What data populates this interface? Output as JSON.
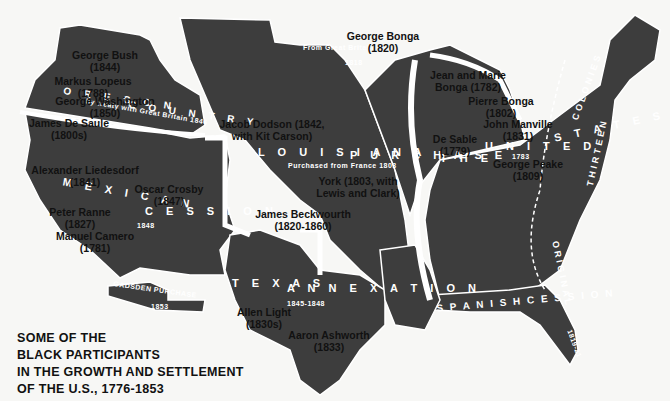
{
  "map": {
    "title_lines": [
      "SOME OF THE",
      "BLACK PARTICIPANTS",
      "IN THE GROWTH AND SETTLEMENT",
      "OF THE U.S., 1776-1853"
    ],
    "colors": {
      "land": "#3d3d3d",
      "border": "#ffffff",
      "background": "#f7f7f5",
      "label": "#111111"
    },
    "regions": {
      "oregon": {
        "name": "OREGON COUNTRY",
        "name_left": "O R E G O N",
        "name_right": "C O U N T R Y",
        "sub": "by treaty with Great Britain 1846"
      },
      "louisiana": {
        "name": "LOUISIANA PURCHASE",
        "name_left": "L O U I S I A N A",
        "name_right": "P U R C H A S E",
        "sub": "Purchased from France 1803"
      },
      "mexican": {
        "name_left": "M E X I C A N",
        "name_right": "C E S S I O N",
        "sub": "1848"
      },
      "texas": {
        "name_left": "T E X A S",
        "name_right": "A N N E X A T I O N",
        "sub": "1845-1848"
      },
      "gadsden": {
        "name": "GADSDEN PURCHASE",
        "sub": "1853"
      },
      "spanish": {
        "name": "S P A N I S H   C E S S I O N",
        "sub": "1819-21"
      },
      "united_states": {
        "name_left": "T H E",
        "name_right": "U N I T E D",
        "name_states": "S T A T E S",
        "sub": "1783"
      },
      "thirteen_colonies": {
        "words": [
          "ORIGINAL",
          "THIRTEEN",
          "COLONIES"
        ]
      },
      "great_britain_north": {
        "sub": "From Great Britain",
        "year": "1818"
      }
    },
    "people": [
      {
        "name": "George Bush",
        "date": "(1844)"
      },
      {
        "name": "Markus Lopeus",
        "date": "(1788)"
      },
      {
        "name": "George Washington",
        "date": "(1850)"
      },
      {
        "name": "James De Saule",
        "date": "(1800s)"
      },
      {
        "name": "Alexander Liedesdorf",
        "date": "(1841)"
      },
      {
        "name": "Peter Ranne",
        "date": "(1827)"
      },
      {
        "name": "Manuel Camero",
        "date": "(1781)"
      },
      {
        "name": "Oscar Crosby",
        "date": "(1847)"
      },
      {
        "name": "Jacob Dodson (1842,",
        "date": "with Kit Carson)"
      },
      {
        "name": "George Bonga",
        "date": "(1820)"
      },
      {
        "name": "Jean and Marie",
        "date": "Bonga (1782)"
      },
      {
        "name": "Pierre Bonga",
        "date": "(1802)"
      },
      {
        "name": "John Manville",
        "date": "(1831)"
      },
      {
        "name": "De Sable",
        "date": "(1779)"
      },
      {
        "name": "George Peake",
        "date": "(1809)"
      },
      {
        "name": "York (1803, with",
        "date": "Lewis and Clark)"
      },
      {
        "name": "James Beckwourth",
        "date": "(1820-1860)"
      },
      {
        "name": "Allen Light",
        "date": "(1830s)"
      },
      {
        "name": "Aaron Ashworth",
        "date": "(1833)"
      }
    ]
  }
}
